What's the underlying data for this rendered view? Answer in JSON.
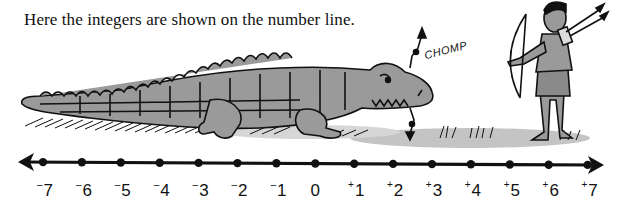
{
  "caption": "Here the integers are shown on the number line.",
  "illustration": {
    "sound_effect": "CHOMP",
    "subjects": [
      "crocodile",
      "archer-boy",
      "bow",
      "arrows",
      "quiver",
      "grass"
    ]
  },
  "number_line": {
    "min": -7,
    "max": 7,
    "arrows": "both-ends",
    "ticks": [
      {
        "value": -7,
        "sign": "-",
        "digit": "7"
      },
      {
        "value": -6,
        "sign": "-",
        "digit": "6"
      },
      {
        "value": -5,
        "sign": "-",
        "digit": "5"
      },
      {
        "value": -4,
        "sign": "-",
        "digit": "4"
      },
      {
        "value": -3,
        "sign": "-",
        "digit": "3"
      },
      {
        "value": -2,
        "sign": "-",
        "digit": "2"
      },
      {
        "value": -1,
        "sign": "-",
        "digit": "1"
      },
      {
        "value": 0,
        "sign": "",
        "digit": "0"
      },
      {
        "value": 1,
        "sign": "+",
        "digit": "1"
      },
      {
        "value": 2,
        "sign": "+",
        "digit": "2"
      },
      {
        "value": 3,
        "sign": "+",
        "digit": "3"
      },
      {
        "value": 4,
        "sign": "+",
        "digit": "4"
      },
      {
        "value": 5,
        "sign": "+",
        "digit": "5"
      },
      {
        "value": 6,
        "sign": "+",
        "digit": "6"
      },
      {
        "value": 7,
        "sign": "+",
        "digit": "7"
      }
    ]
  },
  "colors": {
    "ink": "#111111",
    "fill_gray": "#9a9a9a",
    "shadow_gray": "#c4c4c4",
    "background": "#ffffff"
  }
}
